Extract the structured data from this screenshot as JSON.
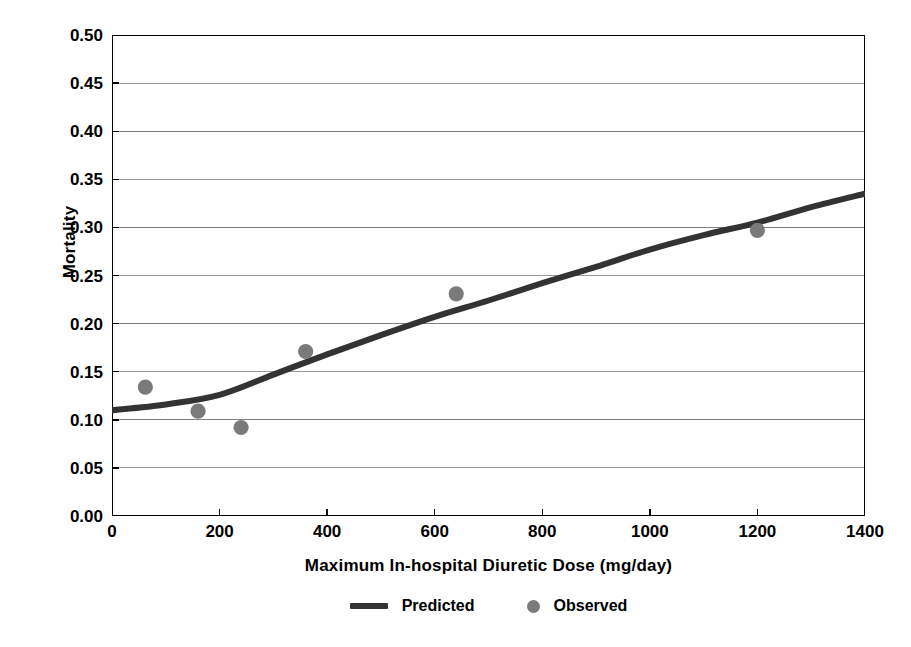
{
  "chart_data": {
    "type": "scatter",
    "title": "",
    "xlabel": "Maximum In-hospital Diuretic Dose (mg/day)",
    "ylabel": "Mortality",
    "xlim": [
      0,
      1400
    ],
    "ylim": [
      0.0,
      0.5
    ],
    "xticks": [
      0,
      200,
      400,
      600,
      800,
      1000,
      1200,
      1400
    ],
    "xtick_labels": [
      "0",
      "200",
      "400",
      "600",
      "800",
      "1000",
      "1200",
      "1400"
    ],
    "yticks": [
      0.0,
      0.05,
      0.1,
      0.15,
      0.2,
      0.25,
      0.3,
      0.35,
      0.4,
      0.45,
      0.5
    ],
    "ytick_labels": [
      "0.00",
      "0.05",
      "0.10",
      "0.15",
      "0.20",
      "0.25",
      "0.30",
      "0.35",
      "0.40",
      "0.45",
      "0.50"
    ],
    "grid": "horizontal",
    "legend_position": "bottom-center",
    "series": [
      {
        "name": "Predicted",
        "type": "line",
        "marker": "line-swatch",
        "color": "#333333",
        "points": [
          {
            "x": 0,
            "y": 0.11
          },
          {
            "x": 100,
            "y": 0.116
          },
          {
            "x": 200,
            "y": 0.126
          },
          {
            "x": 300,
            "y": 0.147
          },
          {
            "x": 400,
            "y": 0.168
          },
          {
            "x": 500,
            "y": 0.188
          },
          {
            "x": 600,
            "y": 0.207
          },
          {
            "x": 700,
            "y": 0.224
          },
          {
            "x": 800,
            "y": 0.242
          },
          {
            "x": 900,
            "y": 0.259
          },
          {
            "x": 1000,
            "y": 0.277
          },
          {
            "x": 1100,
            "y": 0.292
          },
          {
            "x": 1200,
            "y": 0.305
          },
          {
            "x": 1300,
            "y": 0.321
          },
          {
            "x": 1400,
            "y": 0.335
          }
        ]
      },
      {
        "name": "Observed",
        "type": "scatter",
        "marker": "circle",
        "color": "#7a7a7a",
        "points": [
          {
            "x": 62,
            "y": 0.134
          },
          {
            "x": 160,
            "y": 0.109
          },
          {
            "x": 240,
            "y": 0.092
          },
          {
            "x": 360,
            "y": 0.171
          },
          {
            "x": 640,
            "y": 0.231
          },
          {
            "x": 1200,
            "y": 0.297
          }
        ]
      }
    ]
  },
  "legend": {
    "entries": [
      {
        "label": "Predicted"
      },
      {
        "label": "Observed"
      }
    ]
  },
  "colors": {
    "line": "#333333",
    "marker": "#7a7a7a",
    "grid": "#808080",
    "axis": "#000000",
    "background": "#ffffff"
  }
}
